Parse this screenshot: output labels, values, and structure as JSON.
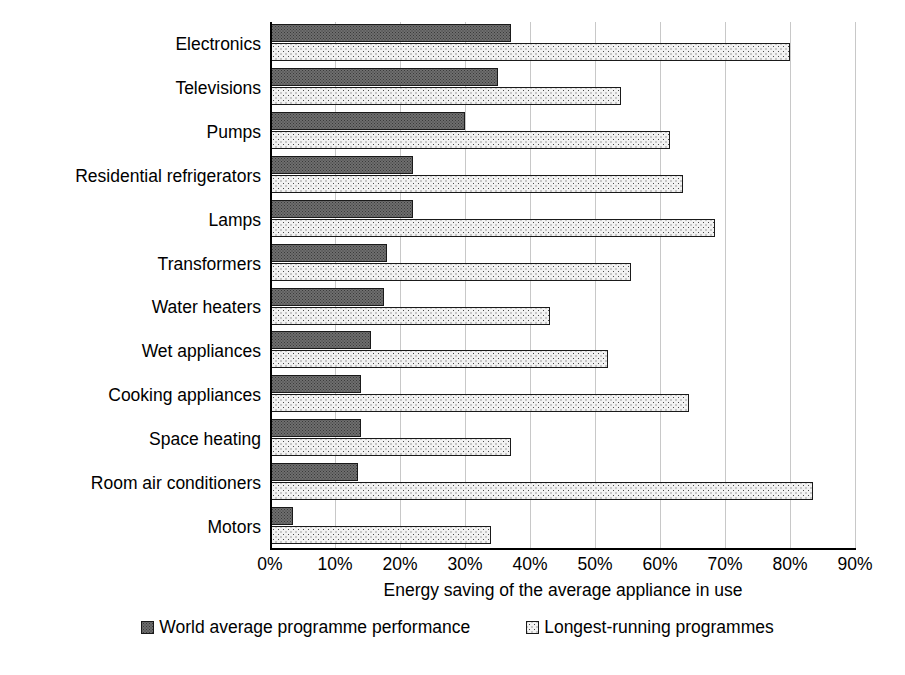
{
  "chart_data": {
    "type": "bar",
    "orientation": "horizontal",
    "title": "",
    "xlabel": "Energy saving of the average appliance in use",
    "ylabel": "",
    "xlim": [
      0,
      90
    ],
    "xunit": "%",
    "grid": true,
    "legend_position": "bottom",
    "xticks": [
      "0%",
      "10%",
      "20%",
      "30%",
      "40%",
      "50%",
      "60%",
      "70%",
      "80%",
      "90%"
    ],
    "xtick_values": [
      0,
      10,
      20,
      30,
      40,
      50,
      60,
      70,
      80,
      90
    ],
    "categories": [
      "Electronics",
      "Televisions",
      "Pumps",
      "Residential refrigerators",
      "Lamps",
      "Transformers",
      "Water heaters",
      "Wet appliances",
      "Cooking appliances",
      "Space heating",
      "Room air conditioners",
      "Motors"
    ],
    "series": [
      {
        "name": "World average programme performance",
        "pattern": "dark-hatched",
        "color": "#6e6e6e",
        "values": [
          37,
          35,
          30,
          22,
          22,
          18,
          17.5,
          15.5,
          14,
          14,
          13.5,
          3.5
        ]
      },
      {
        "name": "Longest-running programmes",
        "pattern": "light-dotted",
        "color": "#f2f2f2",
        "values": [
          80,
          54,
          61.5,
          63.5,
          68.5,
          55.5,
          43,
          52,
          64.5,
          37,
          83.5,
          34
        ]
      }
    ]
  },
  "legend": {
    "items": [
      {
        "label": "World average programme performance",
        "swatch": "dark-hatched"
      },
      {
        "label": "Longest-running programmes",
        "swatch": "light-dotted"
      }
    ]
  }
}
